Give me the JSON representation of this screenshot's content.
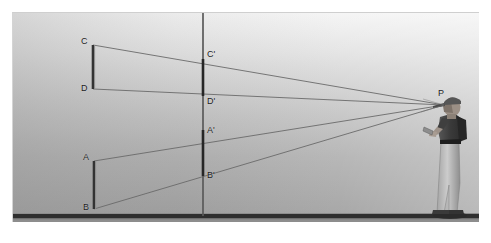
{
  "figure": {
    "kind": "perspective-projection-diagram",
    "background": {
      "sky_top_color": "#f2f2f2",
      "sky_bottom_color": "#9a9a9a",
      "ground_line_color": "#2e2e2e",
      "frame_border_color": "#cfcfcf"
    },
    "line_color": "#6d6d6d",
    "segment_color": "#3a3a3a",
    "picture_plane_color": "#4b4b4b"
  },
  "labels": {
    "object_far_top": "C",
    "object_far_bottom": "D",
    "object_near_top": "A",
    "object_near_bottom": "B",
    "image_far_top": "C'",
    "image_far_bottom": "D'",
    "image_near_top": "A'",
    "image_near_bottom": "B'",
    "eye_point": "P"
  },
  "geometry": {
    "coordinate_space": "diagram pixels, origin at top-left of framed scene area",
    "eye_point": {
      "name": "P",
      "x": 431,
      "y": 92
    },
    "picture_plane": {
      "x": 190,
      "y_top": 0,
      "y_bottom": 203
    },
    "ground_line": {
      "y": 203
    },
    "object_segments": [
      {
        "name": "CD",
        "x": 80,
        "top": {
          "name": "C",
          "y": 32
        },
        "bottom": {
          "name": "D",
          "y": 76
        }
      },
      {
        "name": "AB",
        "x": 81,
        "top": {
          "name": "A",
          "y": 148
        },
        "bottom": {
          "name": "B",
          "y": 196
        }
      }
    ],
    "image_segments": [
      {
        "name": "C'D'",
        "x": 190,
        "top": {
          "name": "C'",
          "y": 46
        },
        "bottom": {
          "name": "D'",
          "y": 83
        }
      },
      {
        "name": "A'B'",
        "x": 190,
        "top": {
          "name": "A'",
          "y": 117
        },
        "bottom": {
          "name": "B'",
          "y": 163
        }
      }
    ],
    "sight_lines": [
      {
        "from": "C",
        "through": "C'",
        "to": "P"
      },
      {
        "from": "D",
        "through": "D'",
        "to": "P"
      },
      {
        "from": "A",
        "through": "A'",
        "to": "P"
      },
      {
        "from": "B",
        "through": "B'",
        "to": "P"
      }
    ]
  },
  "observer": {
    "name": "observer-figure",
    "pose": "standing in profile, facing left, holding object at eye level",
    "cap_color": "#555555",
    "shirt_color": "#3d3d3d",
    "pants_color": "#b9b9b9",
    "skin_color": "#9e9289",
    "ground_shadow_color": "#2b2b2b"
  }
}
